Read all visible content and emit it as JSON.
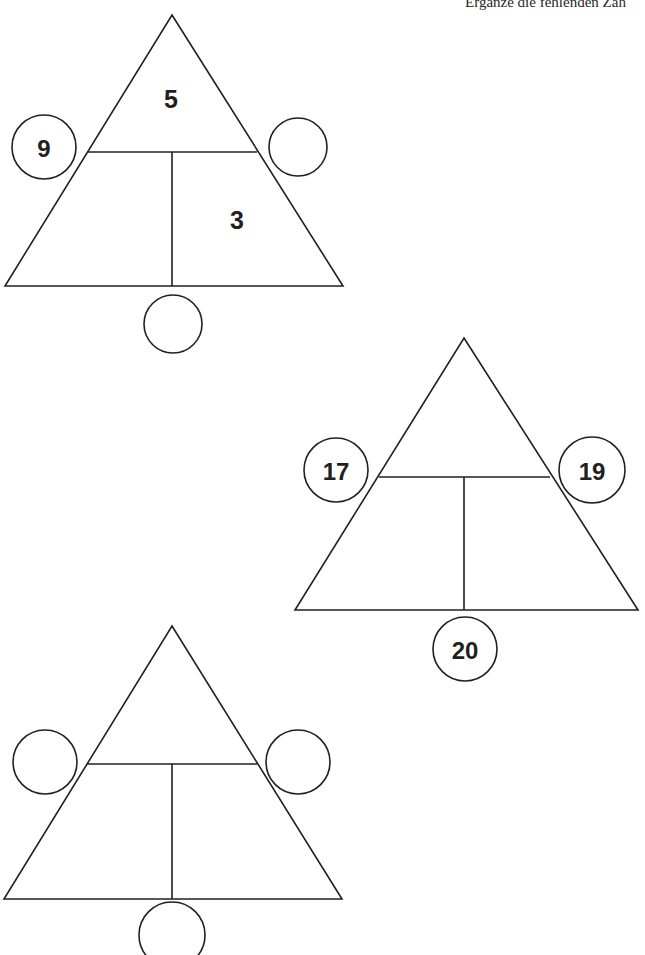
{
  "page": {
    "background_color": "#ffffff",
    "ink_color": "#231f20",
    "instruction_text": "Ergänze die fehlenden Zah"
  },
  "puzzles": [
    {
      "id": "triangle-1",
      "geometry": {
        "apex_x": 172,
        "apex_y": 15,
        "base_y": 286,
        "base_left_x": 5,
        "base_right_x": 343,
        "divider_y": 152,
        "divider_left_x": 88,
        "divider_right_x": 257,
        "stem_x": 172
      },
      "regions": {
        "top": {
          "value": "5",
          "x": 171,
          "y": 99
        },
        "bottom_left": {
          "value": "",
          "x": 118,
          "y": 220
        },
        "bottom_right": {
          "value": "3",
          "x": 237,
          "y": 220
        }
      },
      "circles": {
        "left": {
          "value": "9",
          "cx": 44,
          "cy": 147,
          "r": 32
        },
        "right": {
          "value": "",
          "cx": 298,
          "cy": 147,
          "r": 29
        },
        "bottom": {
          "value": "",
          "cx": 173,
          "cy": 324,
          "r": 29
        }
      }
    },
    {
      "id": "triangle-2",
      "geometry": {
        "apex_x": 464,
        "apex_y": 338,
        "base_y": 610,
        "base_left_x": 295,
        "base_right_x": 638,
        "divider_y": 477,
        "divider_left_x": 379,
        "divider_right_x": 550,
        "stem_x": 464
      },
      "regions": {
        "top": {
          "value": "",
          "x": 464,
          "y": 424
        },
        "bottom_left": {
          "value": "",
          "x": 410,
          "y": 545
        },
        "bottom_right": {
          "value": "",
          "x": 528,
          "y": 545
        }
      },
      "circles": {
        "left": {
          "value": "17",
          "cx": 336,
          "cy": 470,
          "r": 32
        },
        "right": {
          "value": "19",
          "cx": 592,
          "cy": 470,
          "r": 33
        },
        "bottom": {
          "value": "20",
          "cx": 465,
          "cy": 649,
          "r": 32
        }
      }
    },
    {
      "id": "triangle-3",
      "geometry": {
        "apex_x": 172,
        "apex_y": 626,
        "base_y": 899,
        "base_left_x": 4,
        "base_right_x": 342,
        "divider_y": 764,
        "divider_left_x": 87,
        "divider_right_x": 257,
        "stem_x": 172
      },
      "regions": {
        "top": {
          "value": "",
          "x": 172,
          "y": 712
        },
        "bottom_left": {
          "value": "",
          "x": 118,
          "y": 833
        },
        "bottom_right": {
          "value": "",
          "x": 237,
          "y": 833
        }
      },
      "circles": {
        "left": {
          "value": "",
          "cx": 45,
          "cy": 762,
          "r": 32
        },
        "right": {
          "value": "",
          "cx": 298,
          "cy": 762,
          "r": 32
        },
        "bottom": {
          "value": "",
          "cx": 172,
          "cy": 935,
          "r": 33
        }
      }
    }
  ]
}
